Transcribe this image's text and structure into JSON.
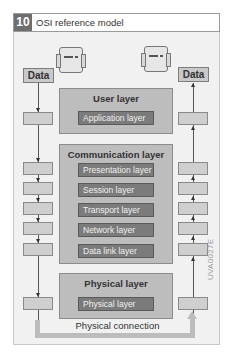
{
  "figure": {
    "number": "10",
    "title": "OSI reference model",
    "code": "UVA0027E"
  },
  "endpoints": {
    "left_data_label": "Data",
    "right_data_label": "Data",
    "left_device_icon": "control-unit-icon",
    "right_device_icon": "control-unit-icon"
  },
  "groups": [
    {
      "title": "User layer",
      "layers": [
        "Application layer"
      ]
    },
    {
      "title": "Communication layer",
      "layers": [
        "Presentation layer",
        "Session layer",
        "Transport layer",
        "Network layer",
        "Data link layer"
      ]
    },
    {
      "title": "Physical layer",
      "layers": [
        "Physical layer"
      ]
    }
  ],
  "connection": {
    "label": "Physical connection"
  },
  "colors": {
    "group_fill": "#bdbdbd",
    "inner_fill": "#7b7b7b",
    "stack_fill": "#cfcfcf",
    "frame_fill": "#f1f1f1",
    "title_number_fill": "#6e6e6e"
  }
}
